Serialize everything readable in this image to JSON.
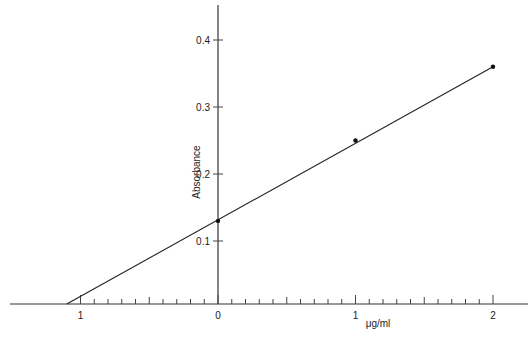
{
  "chart_data": {
    "type": "line",
    "title": "",
    "xlabel": "μg/ml",
    "ylabel": "Absorbance",
    "x_ticks_major": [
      {
        "value": -1,
        "label": "1"
      },
      {
        "value": 0,
        "label": "0"
      },
      {
        "value": 1,
        "label": "1"
      },
      {
        "value": 2,
        "label": "2"
      }
    ],
    "x_minor_step": 0.1,
    "y_ticks": [
      0.1,
      0.2,
      0.3,
      0.4
    ],
    "y_tick_labels": [
      "0.1",
      "0.2",
      "0.3",
      "0.4"
    ],
    "xlim": [
      -1.1,
      2.2
    ],
    "ylim": [
      0,
      0.45
    ],
    "grid": false,
    "legend": null,
    "series": [
      {
        "name": "Standard curve",
        "points": [
          {
            "x": 0,
            "y": 0.13
          },
          {
            "x": 1,
            "y": 0.25
          },
          {
            "x": 2,
            "y": 0.36
          }
        ],
        "extrapolated_line": {
          "from": {
            "x": -1.1,
            "y": 0.0
          },
          "to": {
            "x": 2,
            "y": 0.36
          }
        }
      }
    ]
  },
  "geometry": {
    "x_origin_px": 218,
    "x_unit_px": 137.5,
    "y_zero_px": 308,
    "y_unit_px": 670,
    "x_axis_y_px": 304,
    "x_axis_start_px": 10,
    "x_axis_end_px": 528,
    "y_axis_top_px": 5
  }
}
